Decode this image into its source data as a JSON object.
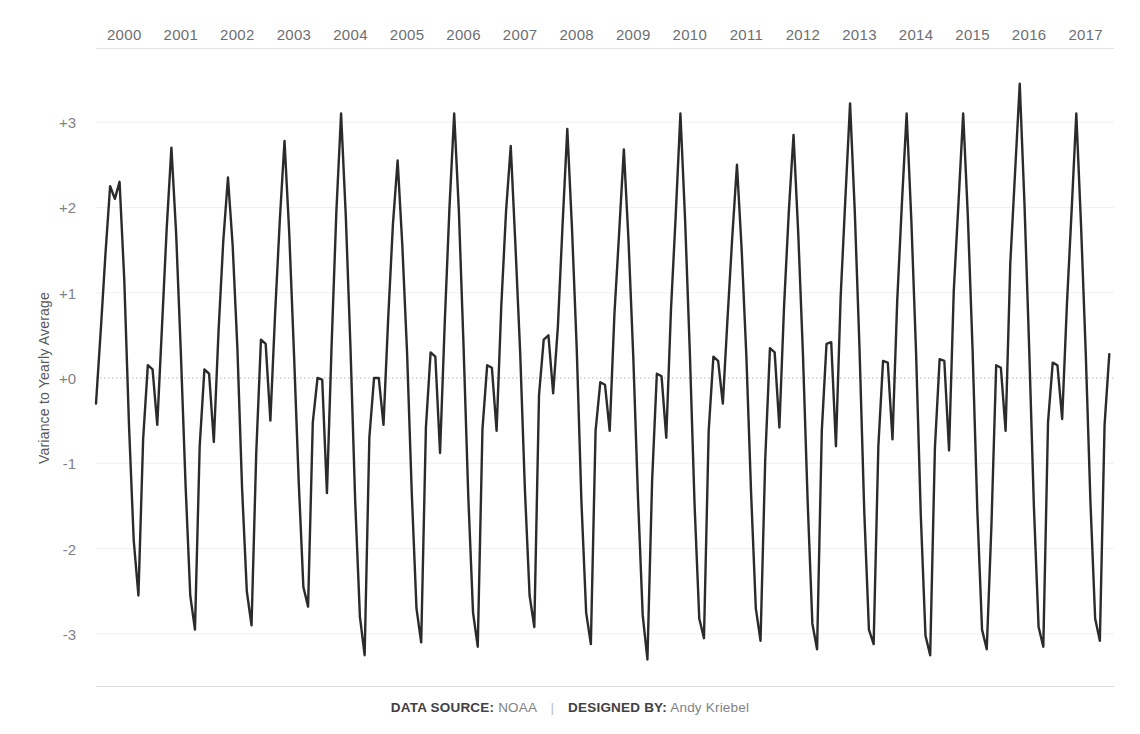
{
  "chart_data": {
    "type": "line",
    "title": "",
    "subtitle": "",
    "xlabel": "",
    "ylabel": "Variance to Yearly Average",
    "xlim": [
      2000.0,
      2018.0
    ],
    "ylim": [
      -3.6,
      3.6
    ],
    "grid": true,
    "gridlines_y": [
      3,
      2,
      1,
      0,
      -1,
      -2,
      -3
    ],
    "zero_line": 0,
    "legend": "none",
    "line_color": "#2b2b2b",
    "line_width": 2.4,
    "x_tick_labels": [
      "2000",
      "2001",
      "2002",
      "2003",
      "2004",
      "2005",
      "2006",
      "2007",
      "2008",
      "2009",
      "2010",
      "2011",
      "2012",
      "2013",
      "2014",
      "2015",
      "2016",
      "2017"
    ],
    "y_tick_labels": [
      "+3",
      "+2",
      "+1",
      "+0",
      "-1",
      "-2",
      "-3"
    ],
    "y_tick_values": [
      3,
      2,
      1,
      0,
      -1,
      -2,
      -3
    ],
    "series": [
      {
        "name": "Variance to Yearly Average",
        "x_start": 2000.0,
        "x_step": 0.0833333,
        "note": "Monthly values, Jan 2000 through Dec 2017",
        "values": [
          -0.3,
          0.55,
          1.45,
          2.25,
          2.1,
          2.3,
          1.15,
          -0.55,
          -1.9,
          -2.55,
          -0.72,
          0.15,
          0.1,
          -0.55,
          0.6,
          1.75,
          2.7,
          1.7,
          0.3,
          -1.25,
          -2.55,
          -2.95,
          -0.8,
          0.1,
          0.05,
          -0.75,
          0.55,
          1.6,
          2.35,
          1.55,
          0.35,
          -1.3,
          -2.5,
          -2.9,
          -0.88,
          0.45,
          0.4,
          -0.5,
          0.75,
          1.85,
          2.78,
          1.7,
          0.3,
          -1.2,
          -2.45,
          -2.68,
          -0.52,
          0.0,
          -0.02,
          -1.35,
          0.4,
          1.95,
          3.1,
          1.9,
          0.35,
          -1.45,
          -2.8,
          -3.25,
          -0.7,
          0.0,
          0.0,
          -0.55,
          0.7,
          1.8,
          2.55,
          1.55,
          0.3,
          -1.35,
          -2.7,
          -3.1,
          -0.58,
          0.3,
          0.25,
          -0.88,
          0.65,
          2.0,
          3.1,
          1.95,
          0.35,
          -1.4,
          -2.75,
          -3.15,
          -0.6,
          0.15,
          0.12,
          -0.62,
          0.85,
          1.95,
          2.72,
          1.55,
          0.3,
          -1.3,
          -2.55,
          -2.92,
          -0.2,
          0.45,
          0.5,
          -0.18,
          0.6,
          1.8,
          2.92,
          1.75,
          0.35,
          -1.45,
          -2.75,
          -3.12,
          -0.62,
          -0.05,
          -0.08,
          -0.62,
          0.75,
          1.7,
          2.68,
          1.6,
          0.25,
          -1.4,
          -2.78,
          -3.3,
          -1.2,
          0.05,
          0.02,
          -0.7,
          0.8,
          1.9,
          3.1,
          1.85,
          0.3,
          -1.48,
          -2.82,
          -3.05,
          -0.62,
          0.25,
          0.2,
          -0.3,
          0.7,
          1.65,
          2.5,
          1.5,
          0.25,
          -1.35,
          -2.7,
          -3.08,
          -0.95,
          0.35,
          0.3,
          -0.58,
          0.85,
          1.95,
          2.85,
          1.7,
          0.28,
          -1.45,
          -2.88,
          -3.18,
          -0.62,
          0.4,
          0.42,
          -0.8,
          0.95,
          2.1,
          3.22,
          1.95,
          0.35,
          -1.55,
          -2.95,
          -3.12,
          -0.8,
          0.2,
          0.18,
          -0.72,
          0.9,
          2.05,
          3.1,
          1.85,
          0.3,
          -1.6,
          -3.02,
          -3.25,
          -0.82,
          0.22,
          0.2,
          -0.85,
          1.02,
          2.05,
          3.1,
          1.88,
          0.32,
          -1.55,
          -2.95,
          -3.18,
          -1.72,
          0.15,
          0.12,
          -0.62,
          1.35,
          2.4,
          3.45,
          2.05,
          0.35,
          -1.5,
          -2.92,
          -3.15,
          -0.52,
          0.18,
          0.15,
          -0.48,
          0.85,
          1.95,
          3.1,
          1.8,
          0.3,
          -1.45,
          -2.82,
          -3.08,
          -0.55,
          0.28
        ]
      }
    ]
  },
  "footer": {
    "data_source_label": "DATA SOURCE:",
    "data_source_value": "NOAA",
    "separator": "|",
    "designer_label": "DESIGNED BY:",
    "designer_value": "Andy Kriebel"
  }
}
